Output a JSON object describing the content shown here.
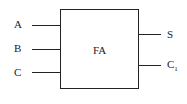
{
  "diagram": {
    "block": {
      "label": "FA"
    },
    "inputs": [
      {
        "label": "A"
      },
      {
        "label": "B"
      },
      {
        "label": "C"
      }
    ],
    "outputs": [
      {
        "label": "S",
        "sub": ""
      },
      {
        "label": "C",
        "sub": "1"
      }
    ]
  }
}
